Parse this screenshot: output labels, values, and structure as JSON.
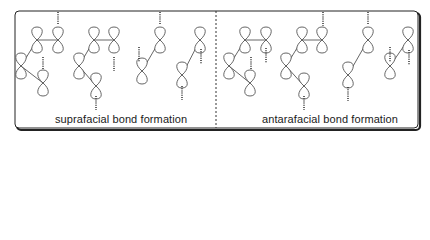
{
  "labels": {
    "left": "suprafacial bond formation",
    "right": "antarafacial bond formation"
  },
  "colors": {
    "line": "#555555",
    "border": "#222222",
    "divider": "#333333"
  },
  "frame": {
    "x": 15,
    "y": 11,
    "w": 403,
    "h": 117,
    "divider_x": 216
  },
  "panels": [
    {
      "name": "suprafacial",
      "groups": [
        {
          "orbitals": [
            [
              21,
              66
            ],
            [
              37,
              40
            ],
            [
              58,
              40
            ],
            [
              43,
              83
            ]
          ],
          "bonds": [
            [
              1,
              2
            ],
            [
              0,
              1
            ],
            [
              0,
              3
            ]
          ],
          "dashes": [
            [
              58,
              12,
              25
            ],
            [
              43,
              57,
              70
            ]
          ]
        },
        {
          "orbitals": [
            [
              79,
              66
            ],
            [
              94,
              40
            ],
            [
              114,
              40
            ],
            [
              96,
              86
            ]
          ],
          "bonds": [
            [
              1,
              2
            ],
            [
              0,
              1
            ],
            [
              0,
              3
            ]
          ],
          "dashes": [
            [
              114,
              57,
              71
            ],
            [
              96,
              96,
              110
            ]
          ]
        },
        {
          "orbitals": [
            [
              142,
              71
            ],
            [
              160,
              40
            ]
          ],
          "bonds": [
            [
              0,
              1
            ]
          ],
          "dashes": [
            [
              160,
              12,
              25
            ],
            [
              139,
              47,
              62
            ]
          ]
        },
        {
          "orbitals": [
            [
              182,
              75
            ],
            [
              200,
              40
            ]
          ],
          "bonds": [
            [
              0,
              1
            ]
          ],
          "dashes": [
            [
              201,
              49,
              64
            ],
            [
              182,
              86,
              100
            ]
          ]
        }
      ]
    },
    {
      "name": "antarafacial",
      "groups": [
        {
          "orbitals": [
            [
              229,
              66
            ],
            [
              245,
              40
            ],
            [
              266,
              40
            ],
            [
              250,
              83
            ]
          ],
          "bonds": [
            [
              1,
              2
            ],
            [
              0,
              1
            ],
            [
              0,
              3
            ]
          ],
          "dashes": [
            [
              266,
              48,
              63
            ],
            [
              251,
              57,
              70
            ]
          ]
        },
        {
          "orbitals": [
            [
              286,
              66
            ],
            [
              302,
              40
            ],
            [
              322,
              40
            ],
            [
              304,
              86
            ]
          ],
          "bonds": [
            [
              1,
              2
            ],
            [
              0,
              1
            ],
            [
              0,
              3
            ]
          ],
          "dashes": [
            [
              323,
              12,
              26
            ],
            [
              304,
              96,
              110
            ]
          ]
        },
        {
          "orbitals": [
            [
              348,
              75
            ],
            [
              368,
              40
            ]
          ],
          "bonds": [
            [
              0,
              1
            ]
          ],
          "dashes": [
            [
              368,
              12,
              25
            ],
            [
              348,
              87,
              101
            ]
          ]
        },
        {
          "orbitals": [
            [
              390,
              66
            ],
            [
              408,
              40
            ]
          ],
          "bonds": [
            [
              0,
              1
            ]
          ],
          "dashes": [
            [
              390,
              47,
              62
            ],
            [
              409,
              50,
              65
            ]
          ]
        }
      ]
    }
  ]
}
